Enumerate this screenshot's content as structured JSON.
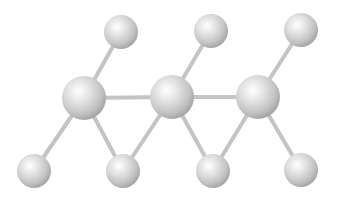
{
  "diagram": {
    "type": "ball-and-stick molecular structure",
    "colors": {
      "background": "#ffffff",
      "bond": "#c4c4c4",
      "atom_highlight": "#ffffff",
      "atom_mid": "#d6d6d6",
      "atom_edge": "#a8a8a8"
    },
    "atoms": [
      {
        "id": "c1",
        "x": 84,
        "y": 98,
        "r": 22,
        "kind": "large"
      },
      {
        "id": "c2",
        "x": 172,
        "y": 97,
        "r": 22,
        "kind": "large"
      },
      {
        "id": "c3",
        "x": 258,
        "y": 97,
        "r": 22,
        "kind": "large"
      },
      {
        "id": "t1",
        "x": 121,
        "y": 32,
        "r": 17,
        "kind": "small"
      },
      {
        "id": "t2",
        "x": 211,
        "y": 31,
        "r": 17,
        "kind": "small"
      },
      {
        "id": "t3",
        "x": 301,
        "y": 30,
        "r": 17,
        "kind": "small"
      },
      {
        "id": "b1",
        "x": 34,
        "y": 171,
        "r": 17,
        "kind": "small"
      },
      {
        "id": "b2",
        "x": 123,
        "y": 171,
        "r": 17,
        "kind": "small"
      },
      {
        "id": "b3",
        "x": 213,
        "y": 171,
        "r": 17,
        "kind": "small"
      },
      {
        "id": "b4",
        "x": 301,
        "y": 170,
        "r": 17,
        "kind": "small"
      }
    ],
    "bonds": [
      [
        "c1",
        "c2"
      ],
      [
        "c2",
        "c3"
      ],
      [
        "c1",
        "t1"
      ],
      [
        "c2",
        "t2"
      ],
      [
        "c3",
        "t3"
      ],
      [
        "c1",
        "b1"
      ],
      [
        "c1",
        "b2"
      ],
      [
        "c2",
        "b2"
      ],
      [
        "c2",
        "b3"
      ],
      [
        "c3",
        "b3"
      ],
      [
        "c3",
        "b4"
      ]
    ]
  }
}
